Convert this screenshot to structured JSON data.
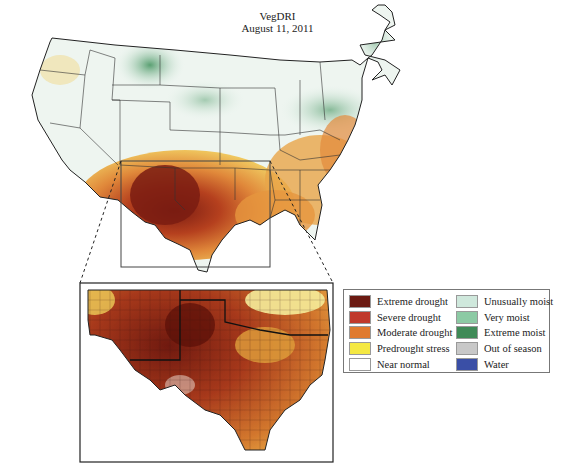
{
  "title": {
    "line1": "VegDRI",
    "line2": "August 11, 2011"
  },
  "map": {
    "main_region": "Contiguous United States",
    "inset_region": "Texas, Oklahoma, New Mexico (zoomed)",
    "selection_box": {
      "x": 121,
      "y": 161,
      "w": 149,
      "h": 106
    },
    "inset_frame": {
      "x": 80,
      "y": 283,
      "w": 253,
      "h": 179
    }
  },
  "legend": {
    "left": [
      {
        "label": "Extreme drought",
        "color": "#6b1a12"
      },
      {
        "label": "Severe drought",
        "color": "#c0392b"
      },
      {
        "label": "Moderate drought",
        "color": "#e07a2e"
      },
      {
        "label": "Predrought stress",
        "color": "#f4e842"
      },
      {
        "label": "Near normal",
        "color": "#ffffff"
      }
    ],
    "right": [
      {
        "label": "Unusually moist",
        "color": "#cfe8dc"
      },
      {
        "label": "Very moist",
        "color": "#8ccaa4"
      },
      {
        "label": "Extreme moist",
        "color": "#3f8a57"
      },
      {
        "label": "Out of season",
        "color": "#c8c8c8"
      },
      {
        "label": "Water",
        "color": "#3a4fa6"
      }
    ]
  }
}
